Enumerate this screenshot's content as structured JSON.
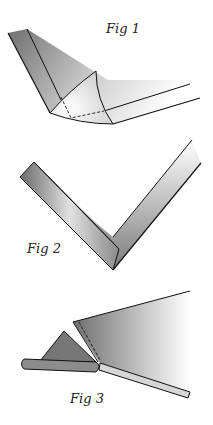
{
  "figures": [
    {
      "label": "Fig 1",
      "description": "Corner with curled triangular flap and dashed fold lines"
    },
    {
      "label": "Fig 2",
      "description": "V-shaped mitered corner with folded edge strip"
    },
    {
      "label": "Fig 3",
      "description": "Folded triangle flap beside rolled edge with dashed fold line"
    }
  ],
  "colors": {
    "line": "#111111",
    "shade_dark": "#777777",
    "shade_light": "#ffffff"
  }
}
